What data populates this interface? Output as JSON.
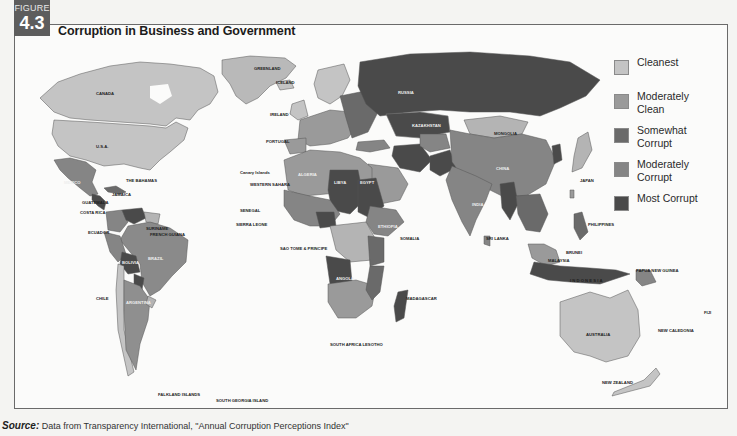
{
  "figure": {
    "label": "FIGURE",
    "number": "4.3",
    "title": "Corruption in Business and Government"
  },
  "legend": {
    "items": [
      {
        "label": "Cleanest",
        "color": "#c4c4c4"
      },
      {
        "label": "Moderately Clean",
        "color": "#9a9a9a"
      },
      {
        "label": "Somewhat Corrupt",
        "color": "#6a6a6a"
      },
      {
        "label": "Moderately Corrupt",
        "color": "#858585"
      },
      {
        "label": "Most Corrupt",
        "color": "#4a4a4a"
      }
    ]
  },
  "map_labels": {
    "north_america": [
      "CANADA",
      "U.S.A.",
      "MEXICO",
      "THE BAHAMAS",
      "CUBA",
      "JAMAICA",
      "HAITI",
      "BELIZE",
      "GUATEMALA",
      "HONDURAS",
      "EL SALVADOR",
      "NICARAGUA",
      "COSTA RICA",
      "PANAMA",
      "GREENLAND"
    ],
    "south_america": [
      "VENEZUELA",
      "GUYANA",
      "SURINAME",
      "FRENCH GUIANA",
      "COLOMBIA",
      "ECUADOR",
      "PERU",
      "BRAZIL",
      "BOLIVIA",
      "PARAGUAY",
      "CHILE",
      "ARGENTINA",
      "URUGUAY",
      "FALKLAND ISLANDS",
      "SOUTH GEORGIA ISLAND"
    ],
    "europe": [
      "ICELAND",
      "IRELAND",
      "NORWAY",
      "FINLAND",
      "PORTUGAL",
      "SPAIN",
      "FRANCE",
      "ITALY",
      "RUSSIA"
    ],
    "africa": [
      "MOROCCO",
      "ALGERIA",
      "TUNISIA",
      "LIBYA",
      "EGYPT",
      "Canary Islands",
      "WESTERN SAHARA",
      "MAURITANIA",
      "MALI",
      "NIGER",
      "CHAD",
      "SUDAN",
      "SENEGAL",
      "GAMBIA",
      "GUINEA BISSAU",
      "SIERRA LEONE",
      "LIBERIA",
      "NIGERIA",
      "CAMEROON",
      "EQUATORIAL GUINEA",
      "SAO TOME & PRINCIPE",
      "ETHIOPIA",
      "SOMALIA",
      "KENYA",
      "ZAIRE",
      "TANZANIA",
      "ANGOLA",
      "ZAMBIA",
      "MALAWI",
      "ZIMBABWE",
      "BOTSWANA",
      "MOZAMBIQUE",
      "MADAGASCAR",
      "SWAZILAND",
      "SOUTH AFRICA",
      "LESOTHO",
      "DJIBOUTI"
    ],
    "asia": [
      "TURKEY",
      "KAZAKHSTAN",
      "MONGOLIA",
      "CHINA",
      "NORTH KOREA",
      "SOUTH KOREA",
      "JAPAN",
      "IRAN",
      "PAKISTAN",
      "INDIA",
      "NEPAL",
      "BHUTAN",
      "BANGLADESH",
      "MYANMAR",
      "THAILAND",
      "VIETNAM",
      "CAMBODIA",
      "HONG KONG",
      "TAIWAN",
      "PHILIPPINES",
      "SRI LANKA",
      "MALAYSIA",
      "SINGAPORE",
      "BRUNEI",
      "INDONESIA",
      "SAUDI ARABIA",
      "QATAR",
      "YEMEN"
    ],
    "oceania": [
      "PAPUA NEW GUINEA",
      "AUSTRALIA",
      "NEW ZEALAND",
      "NEW CALEDONIA",
      "FIJI"
    ]
  },
  "source": {
    "label": "Source:",
    "text": "Data from Transparency International, \"Annual Corruption Perceptions Index\""
  }
}
